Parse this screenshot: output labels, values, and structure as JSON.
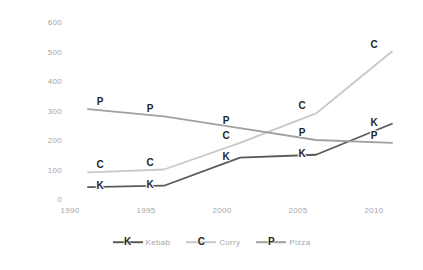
{
  "chart_data": {
    "type": "line",
    "title": "",
    "subtitle": "",
    "xlabel": "",
    "ylabel": "",
    "x": [
      1990,
      1995,
      2000,
      2005,
      2010
    ],
    "xtick_labels": [
      "1990",
      "1995",
      "2000",
      "2005",
      "2010"
    ],
    "ytick_labels": [
      "0",
      "100",
      "200",
      "300",
      "400",
      "500",
      "600"
    ],
    "yticks": [
      0,
      100,
      200,
      300,
      400,
      500,
      600
    ],
    "ylim": [
      0,
      620
    ],
    "xlim": [
      1989,
      2011
    ],
    "grid": false,
    "legend_position": "bottom",
    "series": [
      {
        "name": "Kebab",
        "marker": "K",
        "color": "#595959",
        "values": [
          40,
          45,
          140,
          150,
          255
        ]
      },
      {
        "name": "Curry",
        "marker": "C",
        "color": "#c9c9c9",
        "values": [
          90,
          100,
          190,
          290,
          500
        ]
      },
      {
        "name": "Pizza",
        "marker": "P",
        "color": "#a0a0a0",
        "values": [
          305,
          280,
          240,
          200,
          190
        ]
      }
    ]
  },
  "legend": {
    "items": [
      {
        "label": "Kebab",
        "marker": "K",
        "color": "#595959"
      },
      {
        "label": "Curry",
        "marker": "C",
        "color": "#c9c9c9"
      },
      {
        "label": "Pizza",
        "marker": "P",
        "color": "#a0a0a0"
      }
    ]
  },
  "colors": {
    "background": "#ffffff",
    "tick_text": "#a6a6a6",
    "marker_text": "#262626",
    "kebab": "#595959",
    "curry": "#c9c9c9",
    "pizza": "#a0a0a0"
  }
}
